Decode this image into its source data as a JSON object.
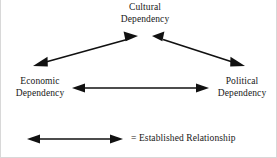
{
  "diagram": {
    "title_text": "",
    "nodes": [
      {
        "id": "cultural",
        "line1": "Cultural",
        "line2": "Dependency"
      },
      {
        "id": "economic",
        "line1": "Economic",
        "line2": "Dependency"
      },
      {
        "id": "political",
        "line1": "Political",
        "line2": "Dependency"
      }
    ],
    "edges": [
      {
        "id": "economic-cultural",
        "from": "economic",
        "to": "cultural",
        "style": "double-arrow"
      },
      {
        "id": "cultural-political",
        "from": "cultural",
        "to": "political",
        "style": "double-arrow"
      },
      {
        "id": "economic-political",
        "from": "economic",
        "to": "political",
        "style": "double-arrow"
      }
    ],
    "legend": {
      "symbol": "double-arrow",
      "text": "= Established Relationship"
    },
    "colors": {
      "line": "#111111",
      "text": "#171717",
      "background": "#ffffff"
    }
  }
}
